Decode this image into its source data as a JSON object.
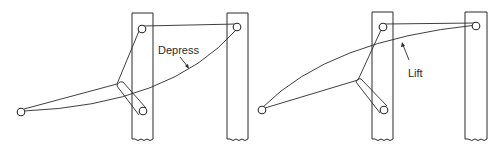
{
  "diagram": {
    "panels": [
      {
        "id": "left",
        "label": "Depress"
      },
      {
        "id": "right",
        "label": "Lift"
      }
    ]
  }
}
